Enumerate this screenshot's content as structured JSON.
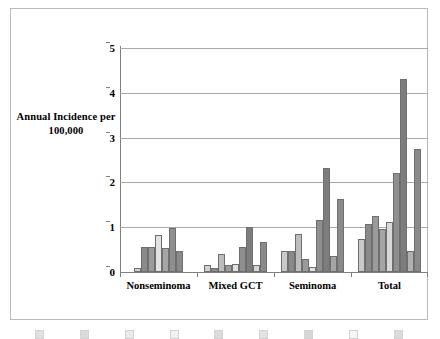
{
  "chart_data": {
    "type": "bar",
    "title": "",
    "subtitle": "",
    "ylabel": "Annual Incidence per 100,000",
    "ylabel_line1": "Annual Incidence per",
    "ylabel_line2": "100,000",
    "xlabel": "",
    "ylim": [
      0,
      5
    ],
    "yticks": [
      "0",
      "1",
      "2",
      "3",
      "4",
      "5"
    ],
    "ytick_values": [
      0,
      1,
      2,
      3,
      4,
      5
    ],
    "grid": "horizontal",
    "legend_position": "bottom (cropped / illegible)",
    "categories": [
      "Nonseminoma",
      "Mixed GCT",
      "Seminoma",
      "Total"
    ],
    "series": [
      {
        "name": "Series 1",
        "color": "#d2d2d2",
        "values": [
          0.1,
          0.15,
          0.48,
          0.73
        ]
      },
      {
        "name": "Series 2",
        "color": "#8a8a8a",
        "values": [
          0.55,
          0.09,
          0.46,
          1.08
        ]
      },
      {
        "name": "Series 3",
        "color": "#9b9b9b",
        "values": [
          0.55,
          0.41,
          0.85,
          1.25
        ]
      },
      {
        "name": "Series 4",
        "color": "#e0e0e0",
        "values": [
          0.83,
          0.16,
          0.28,
          0.96
        ]
      },
      {
        "name": "Series 5",
        "color": "#a5a5a5",
        "values": [
          0.53,
          0.18,
          0.12,
          1.12
        ]
      },
      {
        "name": "Series 6",
        "color": "#8f8f8f",
        "values": [
          0.98,
          0.55,
          1.17,
          2.22
        ]
      },
      {
        "name": "Series 7",
        "color": "#7d7d7d",
        "values": [
          0.0,
          1.0,
          2.33,
          4.3
        ]
      },
      {
        "name": "Series 8",
        "color": "#d8d8d8",
        "values": [
          0.0,
          0.16,
          0.35,
          0.48
        ]
      },
      {
        "name": "Series 9",
        "color": "#8a8a8a",
        "values": [
          0.48,
          0.68,
          1.62,
          2.75
        ]
      }
    ],
    "groups": [
      {
        "label": "Nonseminoma",
        "bars": [
          {
            "value": 0.1,
            "color": "#d2d2d2"
          },
          {
            "value": 0.55,
            "color": "#8a8a8a"
          },
          {
            "value": 0.55,
            "color": "#9b9b9b"
          },
          {
            "value": 0.83,
            "color": "#e2e2e2"
          },
          {
            "value": 0.53,
            "color": "#a5a5a5"
          },
          {
            "value": 0.98,
            "color": "#8f8f8f"
          },
          {
            "value": 0.48,
            "color": "#8a8a8a"
          }
        ]
      },
      {
        "label": "Mixed GCT",
        "bars": [
          {
            "value": 0.15,
            "color": "#d2d2d2"
          },
          {
            "value": 0.09,
            "color": "#8a8a8a"
          },
          {
            "value": 0.41,
            "color": "#bdbdbd"
          },
          {
            "value": 0.16,
            "color": "#9b9b9b"
          },
          {
            "value": 0.18,
            "color": "#e2e2e2"
          },
          {
            "value": 0.55,
            "color": "#8f8f8f"
          },
          {
            "value": 1.0,
            "color": "#7d7d7d"
          },
          {
            "value": 0.16,
            "color": "#d8d8d8"
          },
          {
            "value": 0.68,
            "color": "#8a8a8a"
          }
        ]
      },
      {
        "label": "Seminoma",
        "bars": [
          {
            "value": 0.48,
            "color": "#c9c9c9"
          },
          {
            "value": 0.46,
            "color": "#8a8a8a"
          },
          {
            "value": 0.85,
            "color": "#bdbdbd"
          },
          {
            "value": 0.28,
            "color": "#9b9b9b"
          },
          {
            "value": 0.12,
            "color": "#e2e2e2"
          },
          {
            "value": 1.17,
            "color": "#8f8f8f"
          },
          {
            "value": 2.33,
            "color": "#7d7d7d"
          },
          {
            "value": 0.35,
            "color": "#a5a5a5"
          },
          {
            "value": 1.62,
            "color": "#8a8a8a"
          }
        ]
      },
      {
        "label": "Total",
        "bars": [
          {
            "value": 0.73,
            "color": "#c9c9c9"
          },
          {
            "value": 1.08,
            "color": "#8a8a8a"
          },
          {
            "value": 1.25,
            "color": "#9b9b9b"
          },
          {
            "value": 0.96,
            "color": "#a5a5a5"
          },
          {
            "value": 1.12,
            "color": "#d8d8d8"
          },
          {
            "value": 2.22,
            "color": "#8f8f8f"
          },
          {
            "value": 4.3,
            "color": "#7d7d7d"
          },
          {
            "value": 0.48,
            "color": "#b0b0b0"
          },
          {
            "value": 2.75,
            "color": "#8a8a8a"
          }
        ]
      }
    ]
  },
  "legend": {
    "cropped": true,
    "items": [
      {
        "label": "",
        "color": "#9b9b9b"
      },
      {
        "label": "",
        "color": "#8a8a8a"
      },
      {
        "label": "",
        "color": "#bdbdbd"
      },
      {
        "label": "",
        "color": "#d2d2d2"
      },
      {
        "label": "",
        "color": "#8f8f8f"
      },
      {
        "label": "",
        "color": "#a5a5a5"
      },
      {
        "label": "",
        "color": "#7d7d7d"
      },
      {
        "label": "",
        "color": "#e2e2e2"
      },
      {
        "label": "",
        "color": "#8a8a8a"
      }
    ]
  }
}
